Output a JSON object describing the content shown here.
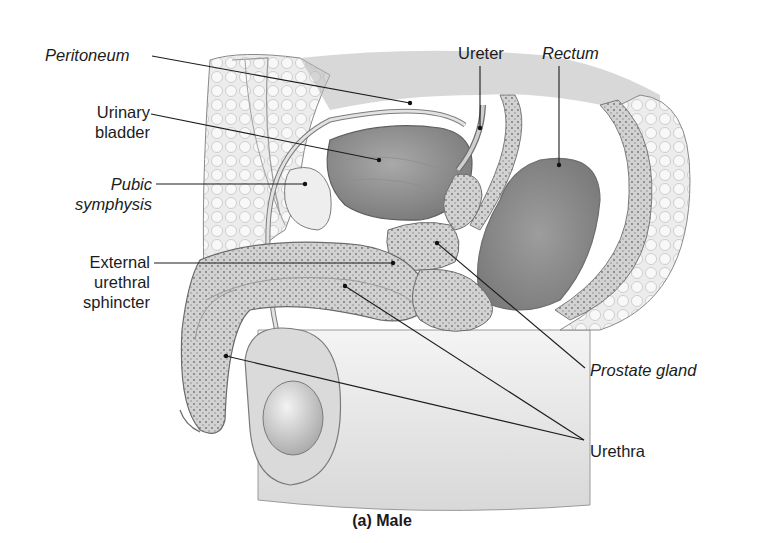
{
  "figure": {
    "caption": "(a) Male",
    "labels": {
      "peritoneum": "Peritoneum",
      "urinary_bladder": [
        "Urinary",
        "bladder"
      ],
      "pubic_symphysis": [
        "Pubic",
        "symphysis"
      ],
      "external_urethral_sphincter": [
        "External",
        "urethral",
        "sphincter"
      ],
      "ureter": "Ureter",
      "rectum": "Rectum",
      "prostate_gland": "Prostate gland",
      "urethra": "Urethra"
    },
    "italic_labels": [
      "Peritoneum",
      "Pubic symphysis",
      "Rectum",
      "Prostate gland"
    ],
    "colors": {
      "background": "#ffffff",
      "ink": "#1c1c1c",
      "tissue_light": "#e6e6e6",
      "tissue_mid": "#bdbdbd",
      "tissue_dark": "#8f8f8f"
    }
  }
}
